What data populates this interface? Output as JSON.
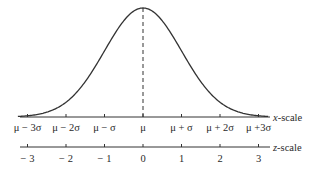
{
  "diagram": {
    "x_axis": {
      "name": "x-scale",
      "ticks": [
        "μ − 3σ",
        "μ − 2σ",
        "μ − σ",
        "μ",
        "μ + σ",
        "μ + 2σ",
        "μ +3σ"
      ]
    },
    "z_axis": {
      "name": "z-scale",
      "ticks": [
        "− 3",
        "− 2",
        "− 1",
        "0",
        "1",
        "2",
        "3"
      ]
    },
    "curve": "bell-shaped normal density curve",
    "mean_line": "dashed vertical line at μ",
    "colors": {
      "line": "#333333",
      "text": "#2a2a2a",
      "background": "#ffffff"
    }
  },
  "chart_data": {
    "type": "line",
    "title": "",
    "xlabel": "x-scale / z-scale",
    "ylabel": "",
    "x": [
      -3,
      -2,
      -1,
      0,
      1,
      2,
      3
    ],
    "x_tick_labels": [
      "μ − 3σ",
      "μ − 2σ",
      "μ − σ",
      "μ",
      "μ + σ",
      "μ + 2σ",
      "μ +3σ"
    ],
    "z_tick_labels": [
      "−3",
      "−2",
      "−1",
      "0",
      "1",
      "2",
      "3"
    ],
    "series": [
      {
        "name": "standard normal density",
        "values": [
          0.0044,
          0.054,
          0.242,
          0.399,
          0.242,
          0.054,
          0.0044
        ]
      }
    ],
    "xlim": [
      -3.2,
      3.2
    ],
    "grid": false,
    "annotations": [
      "dashed vertical line at mean (z = 0)"
    ]
  }
}
